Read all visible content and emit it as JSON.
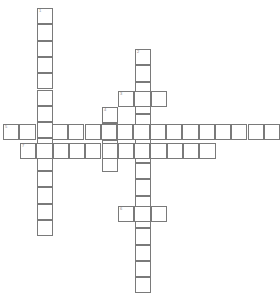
{
  "puzzle": {
    "type": "crossword",
    "cell_size": 16.3,
    "colors": {
      "border": "#7a7a7a",
      "background": "#ffffff",
      "number": "#888888"
    },
    "words": [
      {
        "number": "1",
        "direction": "down",
        "x": 37,
        "y": 8,
        "length": 14
      },
      {
        "number": "2",
        "direction": "down",
        "x": 135,
        "y": 49,
        "length": 15
      },
      {
        "number": "3",
        "direction": "across",
        "x": 118,
        "y": 91,
        "length": 3
      },
      {
        "number": "4",
        "direction": "down",
        "x": 102,
        "y": 107,
        "length": 4
      },
      {
        "number": "5",
        "direction": "across",
        "x": 3,
        "y": 124,
        "length": 17
      },
      {
        "number": "6",
        "direction": "across",
        "x": 118,
        "y": 206,
        "length": 3
      },
      {
        "number": "7",
        "direction": "across",
        "x": 20,
        "y": 143,
        "length": 12
      }
    ]
  }
}
